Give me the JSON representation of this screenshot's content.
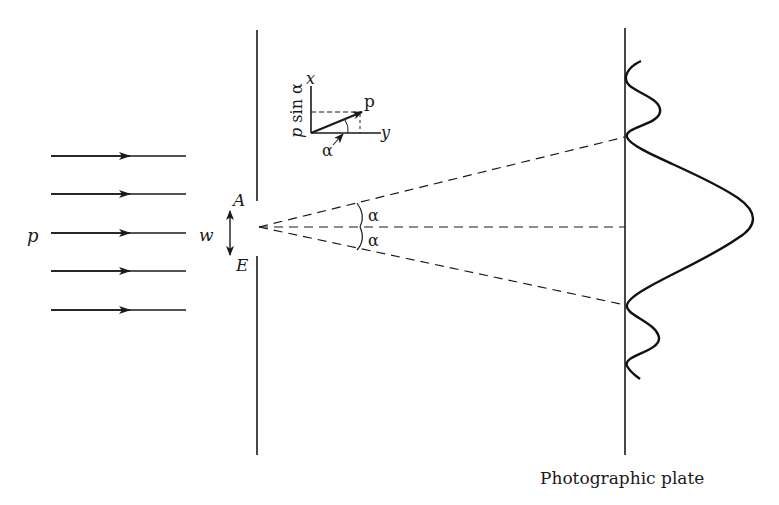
{
  "diagram": {
    "labels": {
      "incident_momentum": "p",
      "slit_width": "w",
      "slit_top": "A",
      "slit_bottom": "E",
      "angle_upper": "α",
      "angle_lower": "α",
      "inset_x_axis": "x",
      "inset_y_axis": "y",
      "inset_vector": "p",
      "inset_component": "p sin α",
      "inset_angle": "α",
      "plate": "Photographic plate"
    },
    "colors": {
      "ink": "#1a1a1a",
      "background": "#ffffff"
    },
    "incident_rays": 5
  }
}
